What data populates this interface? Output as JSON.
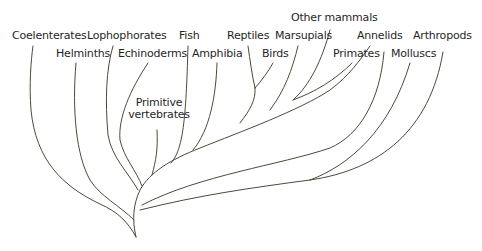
{
  "diagram": {
    "type": "phylogenetic-tree",
    "labels": {
      "coelenterates": "Coelenterates",
      "helminths": "Helminths",
      "lophophorates": "Lophophorates",
      "echinoderms": "Echinoderms",
      "primitive_vertebrates_line1": "Primitive",
      "primitive_vertebrates_line2": "vertebrates",
      "fish": "Fish",
      "amphibia": "Amphibia",
      "reptiles": "Reptiles",
      "birds": "Birds",
      "marsupials": "Marsupials",
      "other_mammals": "Other mammals",
      "primates": "Primates",
      "annelids": "Annelids",
      "molluscs": "Molluscs",
      "arthropods": "Arthropods"
    },
    "line_color": "#4a4a3a",
    "text_color": "#1f1f1f"
  }
}
